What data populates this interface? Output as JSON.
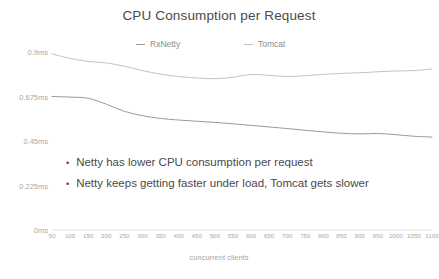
{
  "chart_data": {
    "type": "line",
    "title": "CPU Consumption per Request",
    "xlabel": "concurrent clients",
    "ylabel": "",
    "grid": false,
    "legend_position": "top-center",
    "xlim": [
      50,
      1100
    ],
    "ylim": [
      0,
      0.9
    ],
    "x_tick_labels": [
      "50",
      "100",
      "150",
      "200",
      "250",
      "300",
      "350",
      "400",
      "450",
      "500",
      "550",
      "600",
      "650",
      "700",
      "750",
      "800",
      "850",
      "900",
      "950",
      "1000",
      "1050",
      "1100"
    ],
    "y_tick_labels": [
      "0ms",
      "0.225ms",
      "0.45ms",
      "0.675ms",
      "0.9ms"
    ],
    "y_tick_values": [
      0,
      0.225,
      0.45,
      0.675,
      0.9
    ],
    "categories": [
      50,
      100,
      150,
      200,
      250,
      300,
      350,
      400,
      450,
      500,
      550,
      600,
      650,
      700,
      750,
      800,
      850,
      900,
      950,
      1000,
      1050,
      1100
    ],
    "series": [
      {
        "name": "RxNetty",
        "color": "#9a9a9a",
        "values": [
          0.675,
          0.672,
          0.666,
          0.636,
          0.6,
          0.578,
          0.564,
          0.556,
          0.55,
          0.544,
          0.537,
          0.529,
          0.521,
          0.513,
          0.504,
          0.496,
          0.489,
          0.486,
          0.488,
          0.482,
          0.474,
          0.47
        ]
      },
      {
        "name": "Tomcat",
        "color": "#c2c2c2",
        "values": [
          0.89,
          0.868,
          0.852,
          0.845,
          0.828,
          0.806,
          0.788,
          0.776,
          0.769,
          0.765,
          0.772,
          0.786,
          0.782,
          0.776,
          0.78,
          0.787,
          0.792,
          0.795,
          0.8,
          0.804,
          0.806,
          0.814
        ]
      }
    ],
    "annotations": [
      "Netty has lower CPU consumption per request",
      "Netty keeps getting faster under load, Tomcat gets slower"
    ]
  },
  "legend": {
    "items": [
      {
        "label": "RxNetty"
      },
      {
        "label": "Tomcat"
      }
    ]
  },
  "bullets": {
    "marker": "•",
    "items": [
      {
        "text": "Netty has lower CPU consumption per request"
      },
      {
        "text": "Netty keeps getting faster under load, Tomcat gets slower"
      }
    ]
  },
  "colors": {
    "background": "#ffffff",
    "title": "#4a4a4a",
    "axis_text": "#a8a8a8",
    "series_rxnetty": "#9a9a9a",
    "series_tomcat": "#c2c2c2",
    "axis_line": "#dcdcdc"
  }
}
